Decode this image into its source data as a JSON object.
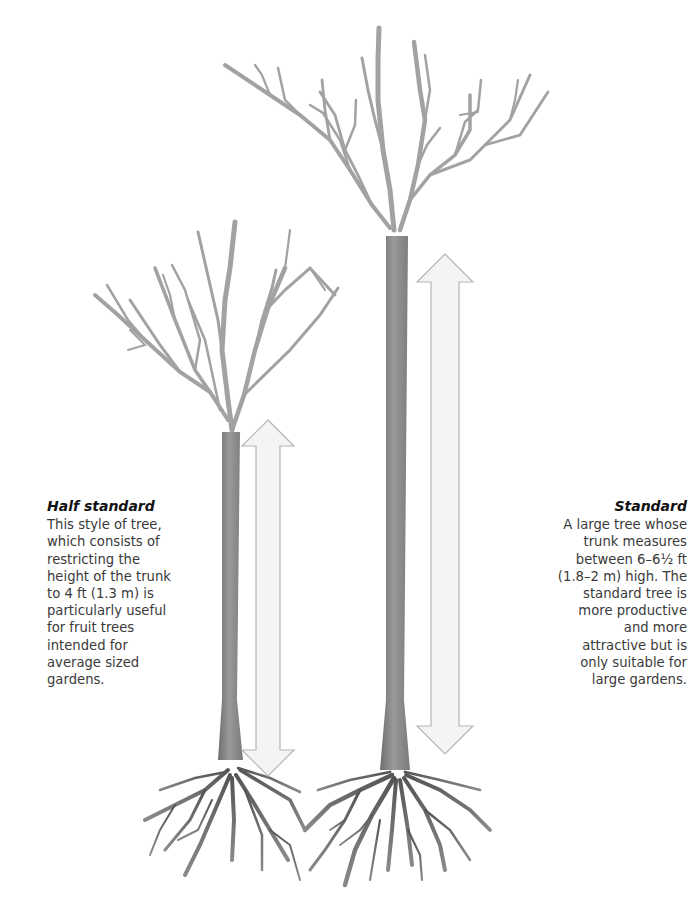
{
  "figure": {
    "type": "illustration",
    "background": "#ffffff"
  },
  "trees": [
    {
      "id": "half-standard",
      "title": "Half standard",
      "body": "This style of tree,\nwhich consists of\nrestricting the\nheight of the trunk\nto 4 ft (1.3 m) is\nparticularly useful\nfor fruit trees\nintended for\naverage sized\ngardens.",
      "trunk_height_ft": "4",
      "trunk_height_m": "1.3",
      "caption_align": "left"
    },
    {
      "id": "standard",
      "title": "Standard",
      "body": "A large tree whose\ntrunk measures\nbetween 6–6½ ft\n(1.8–2 m) high. The\nstandard tree is\nmore productive\nand more\nattractive but is\nonly suitable for\nlarge gardens.",
      "trunk_height_ft": "6–6½",
      "trunk_height_m": "1.8–2",
      "caption_align": "right"
    }
  ],
  "colors": {
    "trunk": "#8a8a8a",
    "trunk_dark": "#5e5e5e",
    "branch": "#9c9c9c",
    "roots": "#555555",
    "arrow_fill": "#f4f4f4",
    "arrow_stroke": "#b5b5b5",
    "text": "#3a3a3a",
    "title": "#111111"
  }
}
